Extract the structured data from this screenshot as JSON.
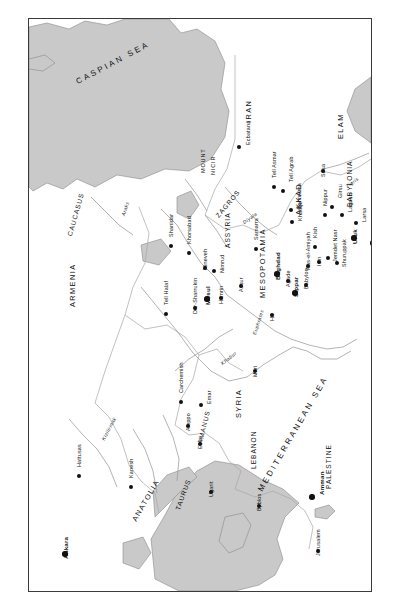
{
  "map": {
    "title": "Map of the Ancient Near East and Mesopotamia",
    "orientation": "rotated-90-counterclockwise",
    "colors": {
      "water": "#c9c9c9",
      "land": "#ffffff",
      "coastline": "#8a8a8a",
      "river": "#9a9a9a",
      "border": "#a6a6a6",
      "text": "#111111",
      "frame": "#3a3a3a"
    },
    "seas": [
      {
        "name": "CASPIAN SEA",
        "x": 46,
        "y": 60,
        "rot": 28,
        "cls": "sea"
      },
      {
        "name": "PERSIAN",
        "x": 352,
        "y": 72,
        "rot": 90,
        "cls": "sea-sm"
      },
      {
        "name": "GULF",
        "x": 368,
        "y": 78,
        "rot": 64,
        "cls": "sea-sm"
      },
      {
        "name": "MEDITERRANEAN SEA",
        "x": 228,
        "y": 470,
        "rot": 60,
        "cls": "sea"
      }
    ],
    "regions": [
      {
        "name": "IRAN",
        "x": 216,
        "y": 104,
        "rot": 90,
        "cls": "region"
      },
      {
        "name": "ELAM",
        "x": 308,
        "y": 120,
        "rot": 90,
        "cls": "region"
      },
      {
        "name": "SUMER",
        "x": 351,
        "y": 186,
        "rot": 90,
        "cls": "region"
      },
      {
        "name": "BABYLONIA",
        "x": 318,
        "y": 188,
        "rot": 90,
        "cls": "region-sm"
      },
      {
        "name": "AKKAD",
        "x": 266,
        "y": 196,
        "rot": 90,
        "cls": "region"
      },
      {
        "name": "ASSYRIA",
        "x": 196,
        "y": 229,
        "rot": 90,
        "cls": "region-sm"
      },
      {
        "name": "MESOPOTAMIA",
        "x": 230,
        "y": 279,
        "rot": 90,
        "cls": "region"
      },
      {
        "name": "CAUCASUS",
        "x": 38,
        "y": 216,
        "rot": 74,
        "cls": "region-sm"
      },
      {
        "name": "ARMENIA",
        "x": 40,
        "y": 288,
        "rot": 90,
        "cls": "region"
      },
      {
        "name": "SYRIA",
        "x": 206,
        "y": 399,
        "rot": 90,
        "cls": "region"
      },
      {
        "name": "LEBANON",
        "x": 222,
        "y": 450,
        "rot": 90,
        "cls": "region-sm"
      },
      {
        "name": "PALESTINE",
        "x": 297,
        "y": 470,
        "rot": 90,
        "cls": "region-sm"
      },
      {
        "name": "ANATOLIA",
        "x": 102,
        "y": 500,
        "rot": 60,
        "cls": "region"
      },
      {
        "name": "TAURUS",
        "x": 146,
        "y": 490,
        "rot": 70,
        "cls": "region-sm"
      },
      {
        "name": "AMANUS",
        "x": 168,
        "y": 424,
        "rot": 76,
        "cls": "region-sm"
      },
      {
        "name": "ZAGROS",
        "x": 186,
        "y": 196,
        "rot": 50,
        "cls": "region-sm"
      }
    ],
    "mountains": [
      {
        "name": "MOUNT",
        "x": 172,
        "y": 154,
        "rot": 90,
        "cls": "mtn"
      },
      {
        "name": "NICIR",
        "x": 182,
        "y": 156,
        "rot": 90,
        "cls": "mtn"
      }
    ],
    "rivers": [
      {
        "name": "Araks",
        "x": 92,
        "y": 196,
        "rot": 72
      },
      {
        "name": "Tigris",
        "x": 316,
        "y": 166,
        "rot": 36
      },
      {
        "name": "Euphrates",
        "x": 223,
        "y": 315,
        "rot": 72
      },
      {
        "name": "Diyala",
        "x": 213,
        "y": 202,
        "rot": 36
      },
      {
        "name": "Karun",
        "x": 350,
        "y": 146,
        "rot": 52
      },
      {
        "name": "Khabur",
        "x": 191,
        "y": 343,
        "rot": 38
      },
      {
        "name": "Kizilirmak",
        "x": 72,
        "y": 420,
        "rot": 62
      }
    ],
    "cities": [
      {
        "name": "Ecbatana",
        "x": 210,
        "y": 128,
        "dx": 7,
        "dy": -2,
        "rot": 90,
        "major": false
      },
      {
        "name": "Susa",
        "x": 294,
        "y": 152,
        "dx": -2,
        "dy": 6,
        "rot": 90,
        "major": false
      },
      {
        "name": "Basra",
        "x": 371,
        "y": 144,
        "dx": -2,
        "dy": 6,
        "rot": 90,
        "major": true
      },
      {
        "name": "Tell Asmar",
        "x": 245,
        "y": 168,
        "dx": -2,
        "dy": -9,
        "rot": 90,
        "major": false
      },
      {
        "name": "Tell Agrab",
        "x": 254,
        "y": 172,
        "dx": 6,
        "dy": -9,
        "rot": 90,
        "major": false
      },
      {
        "name": "Eshnunna",
        "x": 262,
        "y": 191,
        "dx": 6,
        "dy": -1,
        "rot": 90,
        "major": false
      },
      {
        "name": "Khafaje",
        "x": 263,
        "y": 203,
        "dx": 6,
        "dy": -1,
        "rot": 90,
        "major": false
      },
      {
        "name": "Nippur",
        "x": 296,
        "y": 196,
        "dx": -2,
        "dy": -9,
        "rot": 90,
        "major": false
      },
      {
        "name": "Girsu",
        "x": 303,
        "y": 188,
        "dx": 6,
        "dy": -9,
        "rot": 90,
        "major": false
      },
      {
        "name": "Lagash",
        "x": 313,
        "y": 196,
        "dx": 6,
        "dy": -3,
        "rot": 90,
        "major": false
      },
      {
        "name": "Larsa",
        "x": 327,
        "y": 204,
        "dx": 6,
        "dy": -1,
        "rot": 90,
        "major": false
      },
      {
        "name": "Eridu",
        "x": 347,
        "y": 208,
        "dx": 6,
        "dy": -1,
        "rot": 90,
        "major": false
      },
      {
        "name": "Uruk",
        "x": 325,
        "y": 219,
        "dx": -2,
        "dy": 6,
        "rot": 90,
        "major": true
      },
      {
        "name": "Ur",
        "x": 344,
        "y": 224,
        "dx": -2,
        "dy": 6,
        "rot": 90,
        "major": true
      },
      {
        "name": "Tell el-Ubaid",
        "x": 355,
        "y": 230,
        "dx": -2,
        "dy": 6,
        "rot": 90,
        "major": false
      },
      {
        "name": "Kish",
        "x": 286,
        "y": 228,
        "dx": -2,
        "dy": -9,
        "rot": 90,
        "major": false
      },
      {
        "name": "Isin",
        "x": 290,
        "y": 243,
        "dx": -2,
        "dy": 4,
        "rot": 90,
        "major": false
      },
      {
        "name": "Jemdet Nasr",
        "x": 299,
        "y": 239,
        "dx": 5,
        "dy": 4,
        "rot": 90,
        "major": false
      },
      {
        "name": "Shuruppak",
        "x": 308,
        "y": 244,
        "dx": 5,
        "dy": 4,
        "rot": 90,
        "major": false
      },
      {
        "name": "Ras-el-Amiyah",
        "x": 279,
        "y": 247,
        "dx": -2,
        "dy": 4,
        "rot": 90,
        "major": false
      },
      {
        "name": "Babylon",
        "x": 277,
        "y": 266,
        "dx": -2,
        "dy": 4,
        "rot": 90,
        "major": false
      },
      {
        "name": "Sippar",
        "x": 266,
        "y": 274,
        "dx": -2,
        "dy": 4,
        "rot": 90,
        "major": true
      },
      {
        "name": "Agade",
        "x": 259,
        "y": 262,
        "dx": -2,
        "dy": 6,
        "rot": 90,
        "major": false
      },
      {
        "name": "Baghdad",
        "x": 248,
        "y": 255,
        "dx": -2,
        "dy": 6,
        "rot": 90,
        "major": true
      },
      {
        "name": "Hit",
        "x": 243,
        "y": 296,
        "dx": -2,
        "dy": 6,
        "rot": 90,
        "major": false
      },
      {
        "name": "Mari",
        "x": 226,
        "y": 352,
        "dx": -2,
        "dy": 6,
        "rot": 90,
        "major": false
      },
      {
        "name": "Samarra",
        "x": 227,
        "y": 230,
        "dx": -2,
        "dy": -9,
        "rot": 90,
        "major": false
      },
      {
        "name": "Assur",
        "x": 212,
        "y": 267,
        "dx": -2,
        "dy": 6,
        "rot": 90,
        "major": false
      },
      {
        "name": "Hamrin",
        "x": 192,
        "y": 279,
        "dx": -2,
        "dy": 6,
        "rot": 90,
        "major": false
      },
      {
        "name": "Mosul",
        "x": 178,
        "y": 280,
        "dx": -2,
        "dy": 6,
        "rot": 90,
        "major": true
      },
      {
        "name": "Dur-Sharrukin",
        "x": 166,
        "y": 289,
        "dx": -2,
        "dy": 6,
        "rot": 90,
        "major": false
      },
      {
        "name": "Nimrud",
        "x": 185,
        "y": 252,
        "dx": 6,
        "dy": 2,
        "rot": 90,
        "major": false
      },
      {
        "name": "Nineveh",
        "x": 176,
        "y": 249,
        "dx": -2,
        "dy": 2,
        "rot": 90,
        "major": false
      },
      {
        "name": "Khorsabad",
        "x": 160,
        "y": 234,
        "dx": -2,
        "dy": -9,
        "rot": 90,
        "major": false
      },
      {
        "name": "Shanidar",
        "x": 142,
        "y": 227,
        "dx": -2,
        "dy": -9,
        "rot": 90,
        "major": false
      },
      {
        "name": "Tell Halaf",
        "x": 137,
        "y": 295,
        "dx": -2,
        "dy": -9,
        "rot": 90,
        "major": false
      },
      {
        "name": "Carchemish",
        "x": 152,
        "y": 383,
        "dx": -2,
        "dy": -9,
        "rot": 90,
        "major": false
      },
      {
        "name": "Emar",
        "x": 172,
        "y": 386,
        "dx": 6,
        "dy": -1,
        "rot": 90,
        "major": false
      },
      {
        "name": "Aleppo",
        "x": 159,
        "y": 407,
        "dx": -2,
        "dy": 5,
        "rot": 90,
        "major": false
      },
      {
        "name": "Ebla",
        "x": 171,
        "y": 425,
        "dx": -2,
        "dy": 5,
        "rot": 90,
        "major": false
      },
      {
        "name": "Ugarit",
        "x": 182,
        "y": 473,
        "dx": -2,
        "dy": 5,
        "rot": 90,
        "major": false
      },
      {
        "name": "Byblos",
        "x": 230,
        "y": 487,
        "dx": -2,
        "dy": 5,
        "rot": 90,
        "major": false
      },
      {
        "name": "Amman",
        "x": 283,
        "y": 478,
        "dx": 7,
        "dy": -2,
        "rot": 90,
        "major": true
      },
      {
        "name": "Jerusalem",
        "x": 289,
        "y": 532,
        "dx": -2,
        "dy": 5,
        "rot": 90,
        "major": false
      },
      {
        "name": "Kanesh",
        "x": 102,
        "y": 468,
        "dx": -2,
        "dy": -9,
        "rot": 90,
        "major": false
      },
      {
        "name": "Hattusas",
        "x": 50,
        "y": 457,
        "dx": -2,
        "dy": -9,
        "rot": 90,
        "major": false
      },
      {
        "name": "Ankara",
        "x": 36,
        "y": 535,
        "dx": -2,
        "dy": 5,
        "rot": 90,
        "major": true
      }
    ]
  }
}
